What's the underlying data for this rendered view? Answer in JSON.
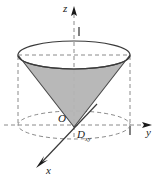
{
  "figure": {
    "axes": {
      "z_label": "z",
      "y_label": "y",
      "x_label": "x"
    },
    "points": {
      "origin_label": "O"
    },
    "region": {
      "base_label": "D",
      "base_subscript": "xy"
    },
    "ticks": {
      "z_tick": "1",
      "y_tick": "1"
    },
    "colors": {
      "stroke": "#3a3a3a",
      "dashed_stroke": "#8a8a8a",
      "cone_fill": "#b4b4b4",
      "cone_edge": "#4a4a4a",
      "background": "#ffffff",
      "text": "#1a1a1a"
    },
    "geometry": {
      "top_ellipse_center_x": 74,
      "top_ellipse_center_y": 55,
      "top_ellipse_rx": 56,
      "top_ellipse_ry": 14,
      "base_ellipse_center_x": 74,
      "base_ellipse_center_y": 125,
      "base_ellipse_rx": 56,
      "base_ellipse_ry": 14,
      "apex_x": 74,
      "apex_y": 127,
      "z_axis_top_y": 8,
      "y_axis_right_x": 152,
      "x_axis_end_x": 36,
      "x_axis_end_y": 167
    },
    "elements": {
      "cone_surface_name": "cone-lateral-surface",
      "cylinder_name": "dashed-cylinder-guide",
      "base_disk_name": "base-disk-region"
    }
  }
}
